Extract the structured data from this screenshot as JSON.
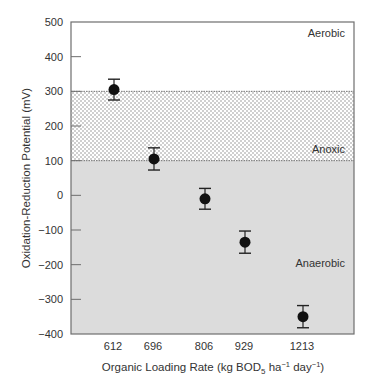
{
  "chart_data": {
    "type": "scatter",
    "title": "",
    "xlabel": "Organic Loading Rate (kg BOD5 ha-1 day-1)",
    "xlabel_parts": {
      "prefix": "Organic Loading Rate (kg BOD",
      "sub": "5",
      "mid1": " ha",
      "sup1": "−1",
      "mid2": " day",
      "sup2": "−1",
      "suffix": ")"
    },
    "ylabel": "Oxidation-Reduction Potential (mV)",
    "categories": [
      "612",
      "696",
      "806",
      "929",
      "1213"
    ],
    "series": [
      {
        "name": "ORP",
        "values": [
          305,
          105,
          -10,
          -135,
          -350
        ],
        "error_plus_minus": [
          30,
          32,
          30,
          32,
          32
        ]
      }
    ],
    "ylim": [
      -400,
      500
    ],
    "yticks": [
      500,
      400,
      300,
      200,
      100,
      0,
      -100,
      -200,
      -300,
      -400
    ],
    "ytick_labels": [
      "500",
      "400",
      "300",
      "200",
      "100",
      "0",
      "−100",
      "−200",
      "−300",
      "−400"
    ],
    "grid": false,
    "legend": null,
    "zones": [
      {
        "name": "Aerobic",
        "from": 300,
        "to": 500,
        "fill": "white"
      },
      {
        "name": "Anoxic",
        "from": 100,
        "to": 300,
        "fill": "dotted"
      },
      {
        "name": "Anaerobic",
        "from": -400,
        "to": 100,
        "fill": "#dcdcdc"
      }
    ]
  },
  "colors": {
    "axis": "#6e6e6e",
    "anaerobic_fill": "#dcdcdc",
    "anoxic_dot": "#7a7a7a",
    "marker": "#111111"
  }
}
